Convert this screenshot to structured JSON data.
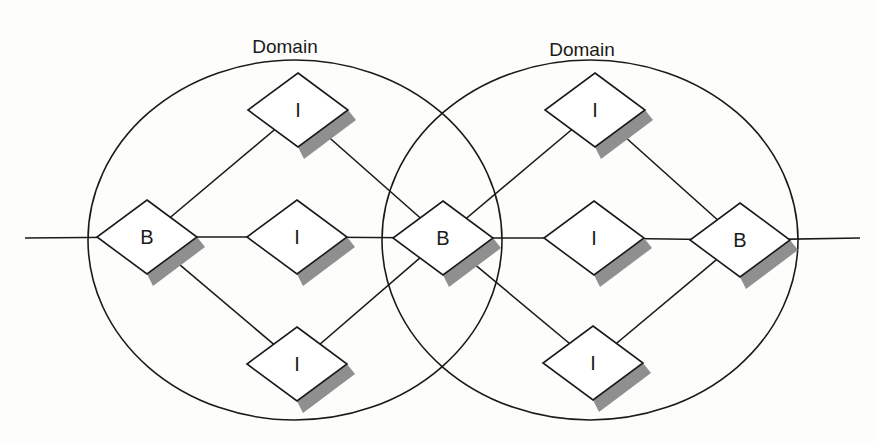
{
  "diagram": {
    "domains": [
      {
        "id": "domain-left",
        "label": "Domain",
        "cx": 295,
        "cy": 240,
        "rx": 207,
        "ry": 180,
        "label_x": 285,
        "label_y": 53
      },
      {
        "id": "domain-right",
        "label": "Domain",
        "cx": 590,
        "cy": 240,
        "rx": 208,
        "ry": 180,
        "label_x": 582,
        "label_y": 56
      }
    ],
    "nodes": [
      {
        "id": "b1",
        "type": "B",
        "label": "B",
        "cx": 147,
        "cy": 237
      },
      {
        "id": "i1",
        "type": "I",
        "label": "I",
        "cx": 298,
        "cy": 110
      },
      {
        "id": "i2",
        "type": "I",
        "label": "I",
        "cx": 297,
        "cy": 237
      },
      {
        "id": "i3",
        "type": "I",
        "label": "I",
        "cx": 297,
        "cy": 364
      },
      {
        "id": "b2",
        "type": "B",
        "label": "B",
        "cx": 443,
        "cy": 238
      },
      {
        "id": "i4",
        "type": "I",
        "label": "I",
        "cx": 595,
        "cy": 110
      },
      {
        "id": "i5",
        "type": "I",
        "label": "I",
        "cx": 594,
        "cy": 238
      },
      {
        "id": "i6",
        "type": "I",
        "label": "I",
        "cx": 593,
        "cy": 363
      },
      {
        "id": "b3",
        "type": "B",
        "label": "B",
        "cx": 740,
        "cy": 240
      }
    ],
    "edges": [
      [
        "ext-left",
        "b1"
      ],
      [
        "b1",
        "i1"
      ],
      [
        "b1",
        "i2"
      ],
      [
        "b1",
        "i3"
      ],
      [
        "i1",
        "b2"
      ],
      [
        "i2",
        "b2"
      ],
      [
        "i3",
        "b2"
      ],
      [
        "b2",
        "i4"
      ],
      [
        "b2",
        "i5"
      ],
      [
        "b2",
        "i6"
      ],
      [
        "i4",
        "b3"
      ],
      [
        "i5",
        "b3"
      ],
      [
        "i6",
        "b3"
      ],
      [
        "b3",
        "ext-right"
      ]
    ],
    "external": {
      "left_x": 25,
      "right_x": 860,
      "y": 238
    },
    "legend": {
      "B": "Border node",
      "I": "Interior node"
    },
    "colors": {
      "stroke": "#1a1a1a",
      "shadow": "#8f8f8f",
      "node_fill": "#ffffff",
      "background": "#fdfdfb"
    }
  }
}
